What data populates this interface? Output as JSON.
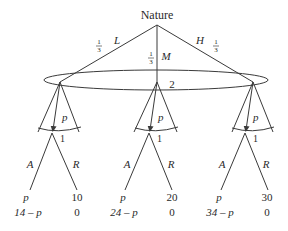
{
  "root": {
    "label": "Nature"
  },
  "nature_branches": [
    {
      "action": "L",
      "prob_num": "1",
      "prob_den": "3"
    },
    {
      "action": "M",
      "prob_num": "1",
      "prob_den": "3"
    },
    {
      "action": "H",
      "prob_num": "1",
      "prob_den": "3"
    }
  ],
  "info_set": {
    "player": "2"
  },
  "subtrees": [
    {
      "offer": "p",
      "responder": "1",
      "accept": "A",
      "reject": "R",
      "accept_payoff_top": "p",
      "accept_payoff_bottom": "14 – p",
      "reject_payoff_top": "10",
      "reject_payoff_bottom": "0"
    },
    {
      "offer": "p",
      "responder": "1",
      "accept": "A",
      "reject": "R",
      "accept_payoff_top": "p",
      "accept_payoff_bottom": "24 – p",
      "reject_payoff_top": "20",
      "reject_payoff_bottom": "0"
    },
    {
      "offer": "p",
      "responder": "1",
      "accept": "A",
      "reject": "R",
      "accept_payoff_top": "p",
      "accept_payoff_bottom": "34 – p",
      "reject_payoff_top": "30",
      "reject_payoff_bottom": "0"
    }
  ],
  "colors": {
    "line": "#3a3a3a",
    "text": "#2a2a2a",
    "background": "#ffffff"
  }
}
